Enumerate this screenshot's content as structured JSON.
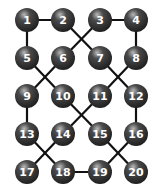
{
  "diagram": {
    "type": "node-link graph",
    "node_radius": 12,
    "colors": {
      "background": "#ffffff",
      "edge": "#111111",
      "node_dark": "#1e1e1e",
      "node_mid": "#4a4a4a",
      "node_highlight": "#b8b8b8",
      "label": "#ffffff"
    },
    "nodes": [
      {
        "id": "1",
        "label": "1",
        "x": 27,
        "y": 20
      },
      {
        "id": "2",
        "label": "2",
        "x": 63,
        "y": 20
      },
      {
        "id": "3",
        "label": "3",
        "x": 100,
        "y": 20
      },
      {
        "id": "4",
        "label": "4",
        "x": 136,
        "y": 20
      },
      {
        "id": "5",
        "label": "5",
        "x": 27,
        "y": 58
      },
      {
        "id": "6",
        "label": "6",
        "x": 63,
        "y": 58
      },
      {
        "id": "7",
        "label": "7",
        "x": 100,
        "y": 58
      },
      {
        "id": "8",
        "label": "8",
        "x": 136,
        "y": 58
      },
      {
        "id": "9",
        "label": "9",
        "x": 27,
        "y": 96
      },
      {
        "id": "10",
        "label": "10",
        "x": 63,
        "y": 96
      },
      {
        "id": "11",
        "label": "11",
        "x": 100,
        "y": 96
      },
      {
        "id": "12",
        "label": "12",
        "x": 136,
        "y": 96
      },
      {
        "id": "13",
        "label": "13",
        "x": 27,
        "y": 134
      },
      {
        "id": "14",
        "label": "14",
        "x": 63,
        "y": 134
      },
      {
        "id": "15",
        "label": "15",
        "x": 100,
        "y": 134
      },
      {
        "id": "16",
        "label": "16",
        "x": 136,
        "y": 134
      },
      {
        "id": "17",
        "label": "17",
        "x": 27,
        "y": 172
      },
      {
        "id": "18",
        "label": "18",
        "x": 63,
        "y": 172
      },
      {
        "id": "19",
        "label": "19",
        "x": 100,
        "y": 172
      },
      {
        "id": "20",
        "label": "20",
        "x": 136,
        "y": 172
      }
    ],
    "edges": [
      [
        "1",
        "2"
      ],
      [
        "1",
        "5"
      ],
      [
        "2",
        "7"
      ],
      [
        "3",
        "6"
      ],
      [
        "3",
        "4"
      ],
      [
        "4",
        "8"
      ],
      [
        "5",
        "10"
      ],
      [
        "6",
        "9"
      ],
      [
        "7",
        "12"
      ],
      [
        "8",
        "11"
      ],
      [
        "9",
        "13"
      ],
      [
        "10",
        "15"
      ],
      [
        "11",
        "14"
      ],
      [
        "12",
        "16"
      ],
      [
        "13",
        "18"
      ],
      [
        "14",
        "17"
      ],
      [
        "15",
        "20"
      ],
      [
        "16",
        "19"
      ],
      [
        "18",
        "19"
      ]
    ]
  }
}
